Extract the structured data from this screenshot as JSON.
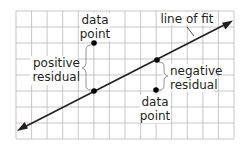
{
  "diagram": {
    "type": "scatter-residual-illustration",
    "colors": {
      "grid": "#b9b9b9",
      "line": "#231f20",
      "point": "#000000",
      "brace": "#8a8a8a",
      "text": "#231f20",
      "background": "#ffffff"
    },
    "grid": {
      "columns": 14,
      "rows": 8
    },
    "labels": {
      "data_point_top_line1": "data",
      "data_point_top_line2": "point",
      "line_of_fit": "line of fit",
      "positive_residual_line1": "positive",
      "positive_residual_line2": "residual",
      "negative_residual_line1": "negative",
      "negative_residual_line2": "residual",
      "data_point_bottom_line1": "data",
      "data_point_bottom_line2": "point"
    }
  }
}
